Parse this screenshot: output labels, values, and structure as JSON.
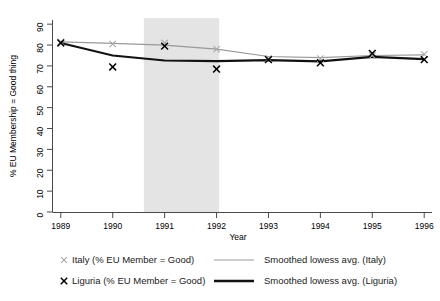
{
  "chart_data": {
    "type": "line",
    "title": "",
    "xlabel": "Year",
    "ylabel": "% EU Membership = Good thing",
    "x": [
      1989,
      1990,
      1991,
      1992,
      1993,
      1994,
      1995,
      1996
    ],
    "xlim": [
      1988.85,
      1996.15
    ],
    "ylim": [
      0,
      92
    ],
    "xticks": [
      1989,
      1990,
      1991,
      1992,
      1993,
      1994,
      1995,
      1996
    ],
    "xtick_labels": [
      "1989",
      "1990",
      "1991",
      "1992",
      "1993",
      "1994",
      "1995",
      "1996"
    ],
    "yticks": [
      0,
      10,
      20,
      30,
      40,
      50,
      60,
      70,
      80,
      90
    ],
    "ytick_labels": [
      "0",
      "10",
      "20",
      "30",
      "40",
      "50",
      "60",
      "70",
      "80",
      "90"
    ],
    "grid": false,
    "legend_position": "below",
    "shaded_band": {
      "x_start": 1990.6,
      "x_end": 1992.05,
      "color": "#e4e4e4",
      "label": ""
    },
    "series": [
      {
        "name": "Italy (% EU Member = Good)",
        "kind": "scatter",
        "marker": "x",
        "color": "#a8a8a8",
        "values": [
          81.5,
          80.5,
          81.0,
          78.0,
          73.5,
          73.5,
          75.0,
          75.5
        ]
      },
      {
        "name": "Liguria (% EU Member = Good)",
        "kind": "scatter",
        "marker": "x",
        "color": "#000000",
        "values": [
          81.0,
          69.5,
          79.5,
          68.5,
          73.0,
          71.5,
          76.0,
          73.0
        ]
      },
      {
        "name": "Smoothed lowess avg. (Italy)",
        "kind": "line",
        "color": "#9a9a9a",
        "values": [
          81.5,
          80.8,
          80.0,
          78.0,
          74.5,
          74.0,
          75.0,
          75.3
        ]
      },
      {
        "name": "Smoothed lowess avg. (Liguria)",
        "kind": "line",
        "color": "#111111",
        "values": [
          81.0,
          75.0,
          72.6,
          72.3,
          72.8,
          72.2,
          74.3,
          73.3
        ]
      }
    ]
  },
  "legend": {
    "entries": [
      {
        "id": "italy-points",
        "marker": "x",
        "style": "marker",
        "label": "Italy (% EU Member = Good)",
        "color": "#a8a8a8"
      },
      {
        "id": "italy-lowess",
        "marker": "line",
        "style": "line-thin",
        "label": "Smoothed lowess avg. (Italy)",
        "color": "#9a9a9a"
      },
      {
        "id": "liguria-points",
        "marker": "x",
        "style": "marker",
        "label": "Liguria (% EU Member = Good)",
        "color": "#000000"
      },
      {
        "id": "liguria-lowess",
        "marker": "line",
        "style": "line-thick",
        "label": "Smoothed lowess avg. (Liguria)",
        "color": "#111111"
      }
    ]
  }
}
